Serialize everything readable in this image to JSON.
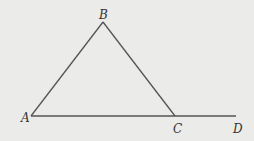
{
  "diagram": {
    "type": "geometry",
    "colors": {
      "background": "#ebebe9",
      "line": "#555555",
      "label": "#333333"
    },
    "points": [
      {
        "id": "A",
        "label": "A",
        "x": 31,
        "y": 116,
        "label_x": 21,
        "label_y": 122
      },
      {
        "id": "B",
        "label": "B",
        "x": 103,
        "y": 22,
        "label_x": 99,
        "label_y": 19
      },
      {
        "id": "C",
        "label": "C",
        "x": 175,
        "y": 116,
        "label_x": 173,
        "label_y": 133
      },
      {
        "id": "D",
        "label": "D",
        "x": 236,
        "y": 116,
        "label_x": 233,
        "label_y": 133
      }
    ],
    "segments": [
      {
        "from": "A",
        "to": "B"
      },
      {
        "from": "B",
        "to": "C"
      },
      {
        "from": "A",
        "to": "D"
      }
    ]
  }
}
